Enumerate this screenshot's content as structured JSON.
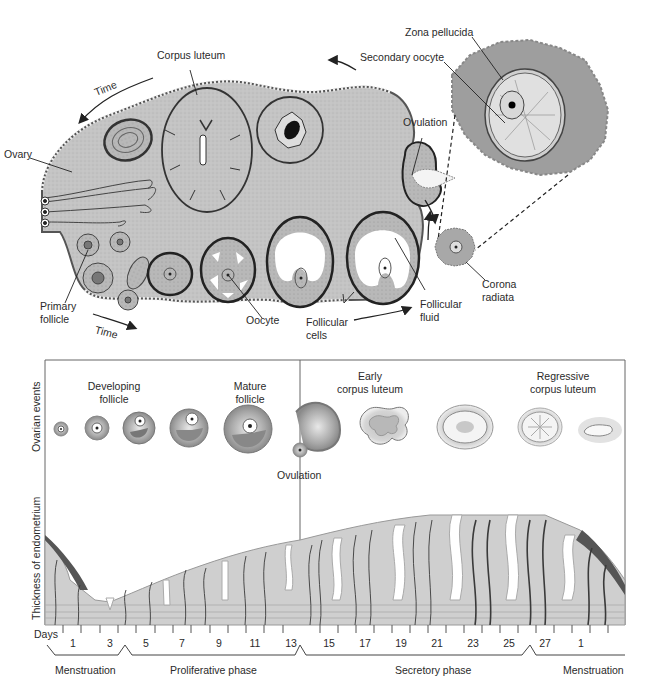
{
  "top_diagram": {
    "labels": {
      "corpus_luteum": "Corpus luteum",
      "time_top": "Time",
      "ovary": "Ovary",
      "zona_pellucida": "Zona pellucida",
      "secondary_oocyte": "Secondary oocyte",
      "ovulation": "Ovulation",
      "primary_follicle_1": "Primary",
      "primary_follicle_2": "follicle",
      "time_bottom": "Time",
      "oocyte": "Oocyte",
      "follicular_cells_1": "Follicular",
      "follicular_cells_2": "cells",
      "follicular_fluid_1": "Follicular",
      "follicular_fluid_2": "fluid",
      "corona_radiata_1": "Corona",
      "corona_radiata_2": "radiata"
    }
  },
  "bottom_diagram": {
    "row_labels": {
      "ovarian_events": "Ovarian events",
      "thickness": "Thickness of endometrium"
    },
    "stage_labels": {
      "developing_1": "Developing",
      "developing_2": "follicle",
      "mature_1": "Mature",
      "mature_2": "follicle",
      "ovulation": "Ovulation",
      "early_cl_1": "Early",
      "early_cl_2": "corpus luteum",
      "regressive_cl_1": "Regressive",
      "regressive_cl_2": "corpus luteum"
    },
    "days_label": "Days",
    "days": [
      "1",
      "3",
      "5",
      "7",
      "9",
      "11",
      "13",
      "15",
      "17",
      "19",
      "21",
      "23",
      "25",
      "27",
      "1"
    ],
    "phases": [
      "Menstruation",
      "Proliferative phase",
      "Secretory phase",
      "Menstruation"
    ]
  },
  "colors": {
    "ovary_fill": "#c8c8c8",
    "ovary_stroke": "#555555",
    "follicle_fill": "#b4b4b4",
    "oocyte_halo": "#8c8c8c",
    "endometrium_fill": "#cfcfcf",
    "vessel": "#3a3a3a",
    "frame": "#666666"
  }
}
